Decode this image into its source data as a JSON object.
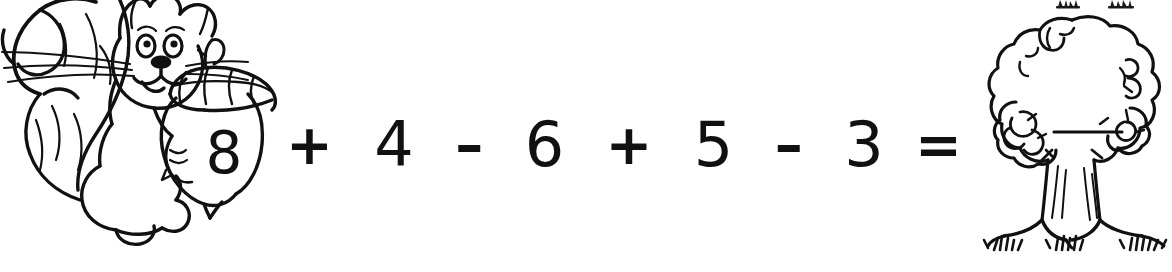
{
  "worksheet": {
    "type": "arithmetic-number-sentence",
    "background_color": "#ffffff",
    "ink_color": "#111111",
    "width": 1172,
    "height": 272
  },
  "left_illustration": {
    "name": "squirrel-holding-acorn",
    "description": "Black and white line-art squirrel with bushy tail holding a large acorn",
    "style": "coloring-book-line-art",
    "label_on_acorn": "8"
  },
  "right_illustration": {
    "name": "oak-tree",
    "description": "Black and white line-art oak tree with leafy canopy, trunk, roots and grass tufts; a blank answer line is drawn across the canopy",
    "style": "coloring-book-line-art",
    "answer_value": ""
  },
  "equation": {
    "full_text": "8 + 4 - 6 + 5 - 3 =",
    "first_operand": "8",
    "first_operand_location": "acorn",
    "tokens": [
      {
        "name": "plus-sign-1",
        "kind": "operator",
        "glyph": "+"
      },
      {
        "name": "operand-4",
        "kind": "number",
        "glyph": "4"
      },
      {
        "name": "minus-sign-1",
        "kind": "operator",
        "glyph": "–"
      },
      {
        "name": "operand-6",
        "kind": "number",
        "glyph": "6"
      },
      {
        "name": "plus-sign-2",
        "kind": "operator",
        "glyph": "+"
      },
      {
        "name": "operand-5",
        "kind": "number",
        "glyph": "5"
      },
      {
        "name": "minus-sign-2",
        "kind": "operator",
        "glyph": "–"
      },
      {
        "name": "operand-3",
        "kind": "number",
        "glyph": "3"
      },
      {
        "name": "equals-sign",
        "kind": "operator",
        "glyph": "="
      }
    ]
  }
}
